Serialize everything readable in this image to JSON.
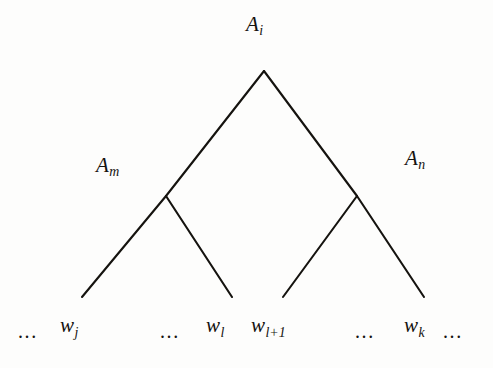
{
  "figure": {
    "kind": "syntax-tree-diagram",
    "background_color": "#fdfdfc",
    "ink_color": "#15130f",
    "root": {
      "symbol": "A",
      "subscript": "i",
      "x": 264,
      "y": 71
    },
    "internal_nodes": [
      {
        "id": "left",
        "symbol": "A",
        "subscript": "m",
        "x": 166,
        "y": 196
      },
      {
        "id": "right",
        "symbol": "A",
        "subscript": "n",
        "x": 357,
        "y": 196
      }
    ],
    "leaf_endpoints": [
      {
        "id": "leaf-1",
        "x": 82,
        "y": 297
      },
      {
        "id": "leaf-2",
        "x": 232,
        "y": 297
      },
      {
        "id": "leaf-3",
        "x": 283,
        "y": 297
      },
      {
        "id": "leaf-4",
        "x": 424,
        "y": 297
      }
    ],
    "edges": [
      {
        "id": "root-to-left",
        "from": "root",
        "to": "left"
      },
      {
        "id": "root-to-right",
        "from": "root",
        "to": "right"
      },
      {
        "id": "left-to-leaf-1",
        "from": "left",
        "to": "leaf-1"
      },
      {
        "id": "left-to-leaf-2",
        "from": "left",
        "to": "leaf-2"
      },
      {
        "id": "right-to-leaf-3",
        "from": "right",
        "to": "leaf-3"
      },
      {
        "id": "right-to-leaf-4",
        "from": "right",
        "to": "leaf-4"
      }
    ],
    "labels": {
      "root": {
        "symbol": "A",
        "subscript": "i"
      },
      "left": {
        "symbol": "A",
        "subscript": "m"
      },
      "right": {
        "symbol": "A",
        "subscript": "n"
      }
    },
    "terminals": [
      {
        "id": "ellipsis-leading",
        "kind": "ellipsis",
        "text": "...",
        "x": 18
      },
      {
        "id": "terminal-wj",
        "kind": "symbol",
        "symbol": "w",
        "subscript": "j",
        "x": 60
      },
      {
        "id": "ellipsis-mid-left",
        "kind": "ellipsis",
        "text": "...",
        "x": 160
      },
      {
        "id": "terminal-wl",
        "kind": "symbol",
        "symbol": "w",
        "subscript": "l",
        "x": 206
      },
      {
        "id": "terminal-wl1",
        "kind": "symbol",
        "symbol": "w",
        "subscript": "l+1",
        "x": 251
      },
      {
        "id": "ellipsis-mid-right",
        "kind": "ellipsis",
        "text": "...",
        "x": 355
      },
      {
        "id": "terminal-wk",
        "kind": "symbol",
        "symbol": "w",
        "subscript": "k",
        "x": 404
      },
      {
        "id": "ellipsis-trailing",
        "kind": "ellipsis",
        "text": "...",
        "x": 443
      }
    ]
  }
}
